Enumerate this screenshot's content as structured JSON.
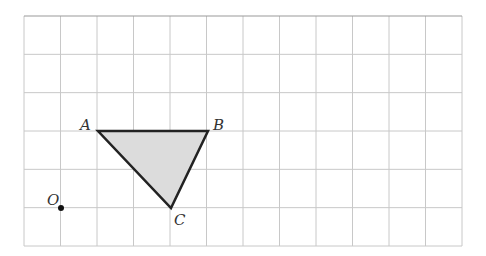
{
  "grid": {
    "left": 24,
    "top": 16,
    "right": 462,
    "bottom": 246,
    "cols": 12,
    "rows": 6,
    "line_color": "#c8c8c8",
    "top_line_color": "#999999"
  },
  "triangle": {
    "fill": "#dcdcdc",
    "stroke": "#222222",
    "vertices": {
      "A": {
        "label": "A",
        "x": 98,
        "y": 131
      },
      "B": {
        "label": "B",
        "x": 208,
        "y": 131
      },
      "C": {
        "label": "C",
        "x": 171,
        "y": 208
      }
    }
  },
  "origin": {
    "label": "O",
    "x": 61,
    "y": 208
  }
}
